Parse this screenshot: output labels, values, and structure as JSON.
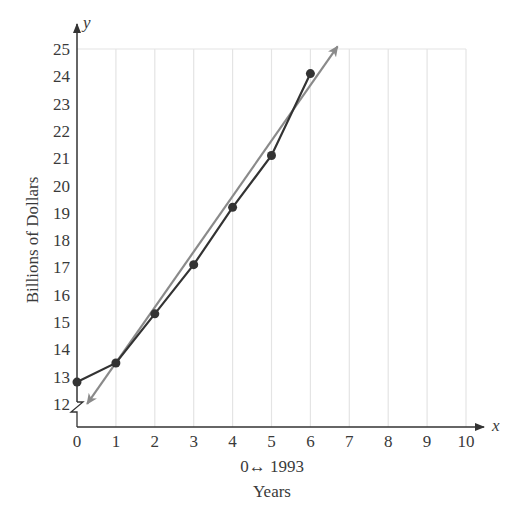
{
  "chart_data": {
    "type": "line",
    "title": "",
    "xlabel": "Years",
    "xlabel_note": "0↔ 1993",
    "ylabel": "Billions of Dollars",
    "x_axis_name": "x",
    "y_axis_name": "y",
    "xlim": [
      0,
      10
    ],
    "ylim": [
      12,
      25
    ],
    "y_axis_break": true,
    "grid": "vertical",
    "x_ticks": [
      "0",
      "1",
      "2",
      "3",
      "4",
      "5",
      "6",
      "7",
      "8",
      "9",
      "10"
    ],
    "y_ticks": [
      "12",
      "13",
      "14",
      "15",
      "16",
      "17",
      "18",
      "19",
      "20",
      "21",
      "22",
      "23",
      "24",
      "25"
    ],
    "x": [
      0,
      1,
      2,
      3,
      4,
      5,
      6
    ],
    "series": [
      {
        "name": "Data",
        "style": "line-with-points",
        "color": "#333333",
        "values": [
          12.8,
          13.5,
          15.3,
          17.1,
          19.2,
          21.1,
          24.1
        ]
      },
      {
        "name": "Regression line",
        "style": "arrow-line",
        "color": "#8a8a8a",
        "from": [
          0.26,
          12.0
        ],
        "to": [
          6.7,
          25.1
        ]
      }
    ],
    "legend": "none"
  },
  "colors": {
    "axis": "#333333",
    "grid": "#e4e4e4",
    "data": "#333333",
    "fit": "#8a8a8a"
  }
}
